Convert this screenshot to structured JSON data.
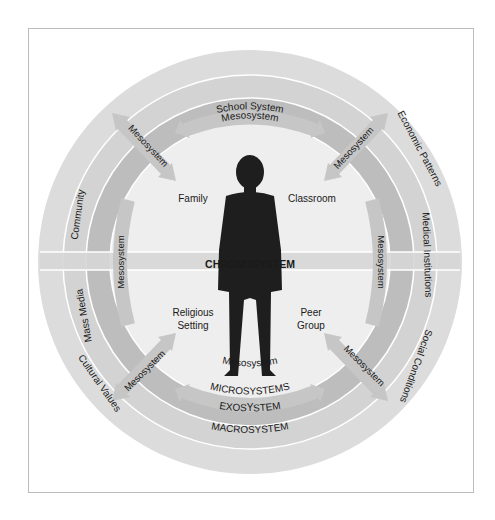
{
  "diagram": {
    "center_label": "CHRONOSYSTEM",
    "rings": {
      "macrosystem": "MACROSYSTEM",
      "exosystem": "EXOSYSTEM",
      "microsystems": "MICROSYSTEMS"
    },
    "macro_items": [
      "Community",
      "Mass Media",
      "Cultural Values",
      "Economic Patterns",
      "Medical Institutions",
      "Social Conditions"
    ],
    "exo_items": [
      "School System"
    ],
    "micro_items": [
      "Family",
      "Classroom",
      "Religious",
      "Setting",
      "Peer",
      "Group"
    ],
    "meso_label": "Mesosystem",
    "colors": {
      "macro": "#dcdcdc",
      "exo": "#d2d2d2",
      "micro": "#b9b9b9",
      "inner": "#efefef",
      "arrow": "#c8c8c8",
      "silhouette": "#1e1e1e"
    }
  }
}
